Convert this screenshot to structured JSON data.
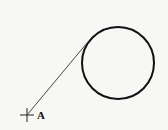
{
  "diagram": {
    "circle": {
      "cx": 118,
      "cy": 63,
      "r": 36,
      "stroke": "#111111",
      "stroke_width": 2
    },
    "tangent_line": {
      "x1": 27,
      "y1": 115,
      "x2": 87,
      "y2": 43,
      "stroke": "#333333"
    },
    "point_A": {
      "x": 27,
      "y": 115,
      "label": "A",
      "marker": "cross"
    }
  }
}
